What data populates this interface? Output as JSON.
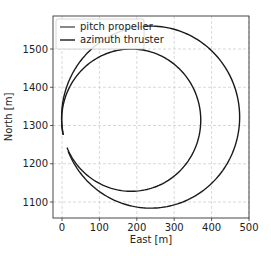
{
  "chart_data": {
    "type": "line",
    "title": "",
    "xlabel": "East [m]",
    "ylabel": "North [m]",
    "xlim": [
      -25,
      500
    ],
    "ylim": [
      1060,
      1590
    ],
    "xticks": [
      0,
      100,
      200,
      300,
      400,
      500
    ],
    "yticks": [
      1100,
      1200,
      1300,
      1400,
      1500
    ],
    "grid": true,
    "grid_style": "dashed",
    "legend_position": "upper left",
    "series": [
      {
        "name": "pitch propeller",
        "color": "#1a1a1a",
        "shape": "circle",
        "center": [
          237,
          1322
        ],
        "radius": 238,
        "start": [
          0,
          1275
        ]
      },
      {
        "name": "azimuth thruster",
        "color": "#1a1a1a",
        "shape": "circle",
        "center": [
          185,
          1314
        ],
        "radius": 186,
        "start": [
          0,
          1275
        ]
      }
    ]
  },
  "legend": {
    "items": [
      {
        "label": "pitch propeller",
        "color": "#555555"
      },
      {
        "label": "azimuth thruster",
        "color": "#1a1a1a"
      }
    ]
  },
  "axes": {
    "xlabel": "East [m]",
    "ylabel": "North [m]",
    "xtick_labels": [
      "0",
      "100",
      "200",
      "300",
      "400",
      "500"
    ],
    "ytick_labels": [
      "1100",
      "1200",
      "1300",
      "1400",
      "1500"
    ]
  }
}
